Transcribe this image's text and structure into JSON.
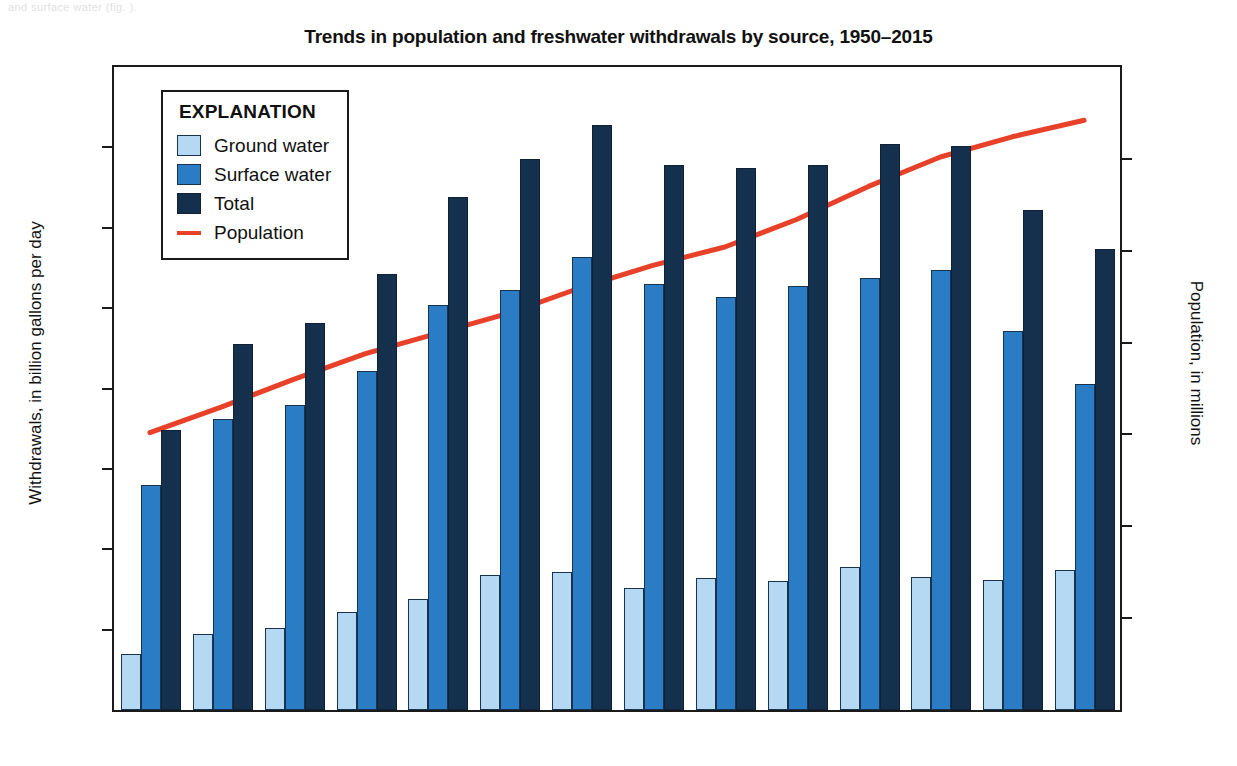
{
  "page_fragment": "and surface water  (fig.          ).",
  "chart_data": {
    "type": "bar",
    "title": "Trends in population and freshwater withdrawals by source, 1950–2015",
    "xlabel": "",
    "ylabel": "Withdrawals, in billion gallons per day",
    "y2label": "Population, in millions",
    "ylim": [
      0,
      400
    ],
    "y2lim": [
      0,
      350
    ],
    "yticks": [
      0,
      50,
      100,
      150,
      200,
      250,
      300,
      350,
      400
    ],
    "y2ticks": [
      0,
      50,
      100,
      150,
      200,
      250,
      300,
      350
    ],
    "grid": false,
    "legend_position": "top-left",
    "legend_title": "EXPLANATION",
    "categories": [
      "1950",
      "1955",
      "1960",
      "1965",
      "1970",
      "1975",
      "1980",
      "1985",
      "1990",
      "1995",
      "2000",
      "2005",
      "2010",
      "2015"
    ],
    "series": [
      {
        "name": "Ground water",
        "type": "bar",
        "axis": "left",
        "color": "#b5d9f2",
        "values": [
          35,
          47,
          51,
          61,
          69,
          84,
          86,
          76,
          82,
          80,
          89,
          83,
          81,
          87
        ]
      },
      {
        "name": "Surface water",
        "type": "bar",
        "axis": "left",
        "color": "#2a7dc4",
        "values": [
          140,
          181,
          190,
          211,
          252,
          261,
          282,
          265,
          257,
          264,
          269,
          274,
          236,
          203
        ]
      },
      {
        "name": "Total",
        "type": "bar",
        "axis": "left",
        "color": "#15304d",
        "values": [
          174,
          228,
          241,
          271,
          319,
          343,
          364,
          339,
          337,
          339,
          352,
          351,
          311,
          287
        ]
      },
      {
        "name": "Population",
        "type": "line",
        "axis": "right",
        "color": "#e8412a",
        "values": [
          151,
          165,
          180,
          194,
          205,
          216,
          230,
          242,
          252,
          267,
          285,
          301,
          312,
          321
        ]
      }
    ]
  },
  "legend": {
    "title": "EXPLANATION",
    "items": [
      {
        "label": "Ground water",
        "swatch": "ground"
      },
      {
        "label": "Surface water",
        "swatch": "surface"
      },
      {
        "label": "Total",
        "swatch": "total"
      },
      {
        "label": "Population",
        "swatch": "line"
      }
    ]
  },
  "colors": {
    "ground_water": "#b5d9f2",
    "surface_water": "#2a7dc4",
    "total": "#15304d",
    "population_line": "#e8412a",
    "axis": "#1a1a1a",
    "background": "#ffffff"
  }
}
